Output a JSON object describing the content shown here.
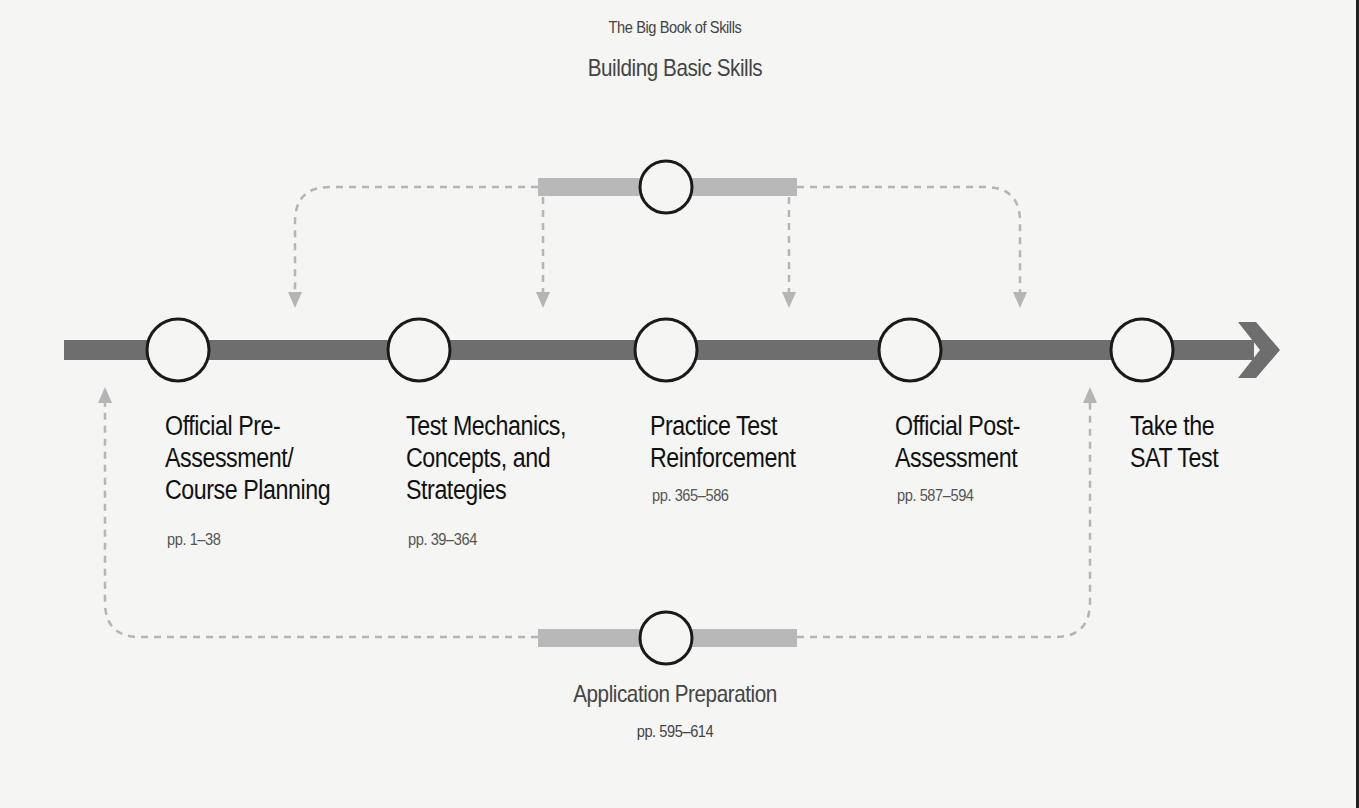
{
  "top_branch": {
    "subtitle": "The Big Book of Skills",
    "title": "Building Basic Skills"
  },
  "stages": [
    {
      "line1": "Official Pre-",
      "line2": "Assessment/",
      "line3": "Course Planning",
      "pages": "pp. 1–38"
    },
    {
      "line1": "Test Mechanics,",
      "line2": "Concepts, and",
      "line3": "Strategies",
      "pages": "pp. 39–364"
    },
    {
      "line1": "Practice Test",
      "line2": "Reinforcement",
      "line3": "",
      "pages": "pp. 365–586"
    },
    {
      "line1": "Official Post-",
      "line2": "Assessment",
      "line3": "",
      "pages": "pp. 587–594"
    },
    {
      "line1": "Take the",
      "line2": "SAT Test",
      "line3": "",
      "pages": ""
    }
  ],
  "bottom_branch": {
    "title": "Application Preparation",
    "pages": "pp. 595–614"
  },
  "colors": {
    "main_bar": "#6e6e6e",
    "branch_bar": "#b8b8b8",
    "dashed": "#b5b5b5",
    "circle": "#1a1a1a"
  }
}
